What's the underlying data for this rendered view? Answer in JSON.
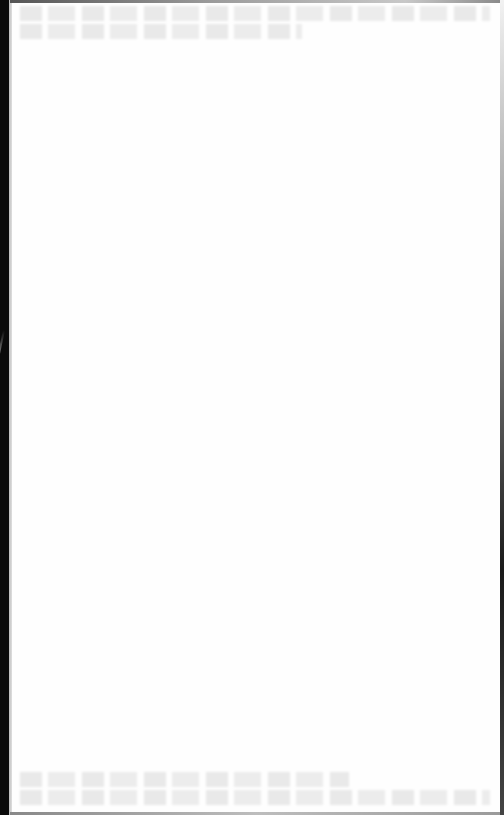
{
  "document": {
    "type": "scanned-page",
    "state": "blank",
    "visible_text": "",
    "notes_visible": false
  },
  "scan": {
    "background_color": "#fefefe",
    "binding_shadow_color": "#0a0a0a",
    "edge_color": "#1a1a1a",
    "bleed_through_color": "#e6e6e6",
    "bleed_through_regions": [
      "top",
      "bottom"
    ]
  }
}
